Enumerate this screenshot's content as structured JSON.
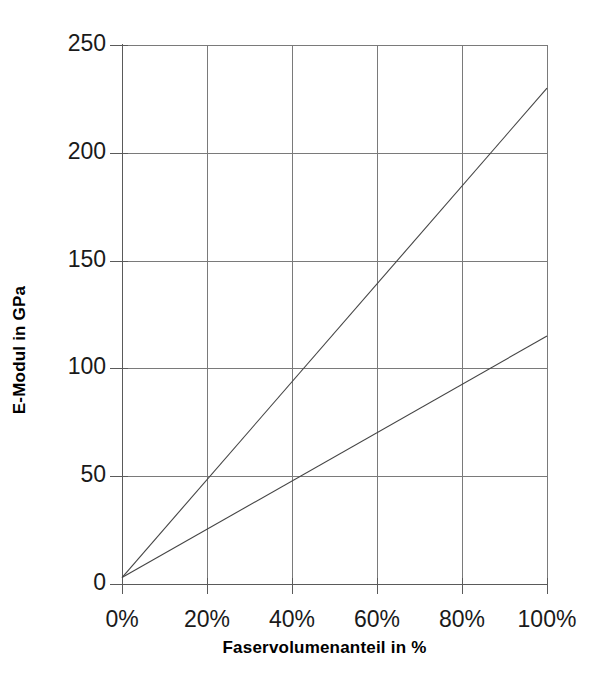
{
  "chart_data": {
    "type": "line",
    "title": "",
    "xlabel": "Faservolumenanteil in %",
    "ylabel": "E-Modul in GPa",
    "xlim": [
      0,
      100
    ],
    "ylim": [
      0,
      250
    ],
    "grid": true,
    "legend": "none",
    "x_tick_labels": [
      "0%",
      "20%",
      "40%",
      "60%",
      "80%",
      "100%"
    ],
    "x_tick_values": [
      0,
      20,
      40,
      60,
      80,
      100
    ],
    "y_tick_labels": [
      "0",
      "50",
      "100",
      "150",
      "200",
      "250"
    ],
    "y_tick_values": [
      0,
      50,
      100,
      150,
      200,
      250
    ],
    "x": [
      0,
      100
    ],
    "series": [
      {
        "name": "steile Gerade",
        "values": [
          3,
          230
        ],
        "color": "#444444",
        "width": 1.1
      },
      {
        "name": "flache Gerade",
        "values": [
          3,
          115
        ],
        "color": "#444444",
        "width": 1.1
      }
    ],
    "colors": {
      "axis": "#5a5a5a",
      "grid": "#7a7a7a",
      "line": "#444444",
      "text": "#1a1a1a",
      "background": "#ffffff"
    }
  },
  "plot_geometry": {
    "left": 122,
    "right": 547,
    "top": 45,
    "bottom": 584
  }
}
